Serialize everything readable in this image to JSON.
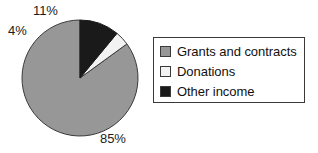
{
  "chart_data": {
    "type": "pie",
    "title": "",
    "subtitle": "",
    "xlabel": "",
    "ylabel": "",
    "grid": false,
    "legend_position": "right",
    "start_angle_deg": 90,
    "direction": "counterclockwise",
    "categories": [
      "Grants and contracts",
      "Donations",
      "Other income"
    ],
    "values": [
      85,
      4,
      11
    ],
    "value_unit": "%",
    "data_labels": [
      "85%",
      "4%",
      "11%"
    ],
    "colors": [
      "#979797",
      "#f2f2f2",
      "#1a1a1a"
    ],
    "slices": [
      {
        "label": "Grants and contracts",
        "value": 85,
        "data_label": "85%",
        "color": "#979797"
      },
      {
        "label": "Donations",
        "value": 4,
        "data_label": "4%",
        "color": "#f2f2f2"
      },
      {
        "label": "Other income",
        "value": 11,
        "data_label": "11%",
        "color": "#1a1a1a"
      }
    ]
  },
  "pie": {
    "labels": {
      "other_income": "11%",
      "donations": "4%",
      "grants": "85%"
    }
  },
  "legend": {
    "items": [
      {
        "label": "Grants and contracts",
        "color": "#979797"
      },
      {
        "label": "Donations",
        "color": "#f2f2f2"
      },
      {
        "label": "Other income",
        "color": "#1a1a1a"
      }
    ]
  },
  "colors": {
    "grants": "#979797",
    "donations": "#f2f2f2",
    "other_income": "#1a1a1a",
    "outline": "#3a3a3a",
    "text": "#111111",
    "background": "#ffffff"
  }
}
